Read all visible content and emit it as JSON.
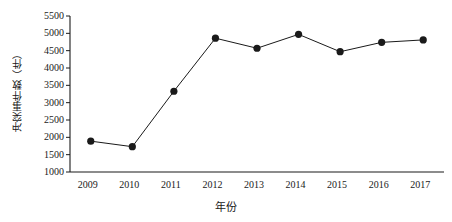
{
  "chart_data": {
    "type": "line",
    "title": "",
    "xlabel": "年份",
    "ylabel": "冲突事件数（件）",
    "categories": [
      "2009",
      "2010",
      "2011",
      "2012",
      "2013",
      "2014",
      "2015",
      "2016",
      "2017"
    ],
    "x": [
      2009,
      2010,
      2011,
      2012,
      2013,
      2014,
      2015,
      2016,
      2017
    ],
    "values": [
      1890,
      1730,
      3330,
      4860,
      4570,
      4970,
      4470,
      4740,
      4810
    ],
    "series": [
      {
        "name": "冲突事件数",
        "values": [
          1890,
          1730,
          3330,
          4860,
          4570,
          4970,
          4470,
          4740,
          4810
        ]
      }
    ],
    "ylim": [
      1000,
      5500
    ],
    "ytick_values": [
      1000,
      1500,
      2000,
      2500,
      3000,
      3500,
      4000,
      4500,
      5000,
      5500
    ],
    "ytick_labels": [
      "1000",
      "1500",
      "2000",
      "2500",
      "3000",
      "3500",
      "4000",
      "4500",
      "5000",
      "5500"
    ],
    "xtick_labels": [
      "2009",
      "2010",
      "2011",
      "2012",
      "2013",
      "2014",
      "2015",
      "2016",
      "2017"
    ],
    "grid": false,
    "legend": false,
    "legend_position": "none",
    "line_color": "#1a1a1a",
    "marker_color": "#1a1a1a",
    "marker": "circle",
    "background_color": "#ffffff",
    "axis_color": "#1a1a1a"
  },
  "axes": {
    "y_title": "冲突事件数（件）",
    "x_title": "年份"
  }
}
